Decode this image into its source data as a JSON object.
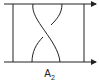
{
  "diagram": {
    "label": "A",
    "label_subscript": "2",
    "stroke_color": "#222222",
    "background": "#ffffff",
    "elements": [
      "top-arrow-line",
      "bottom-arrow-line",
      "left-vertical-bar",
      "right-vertical-bar",
      "crossing-over-strand",
      "crossing-under-strand"
    ]
  }
}
